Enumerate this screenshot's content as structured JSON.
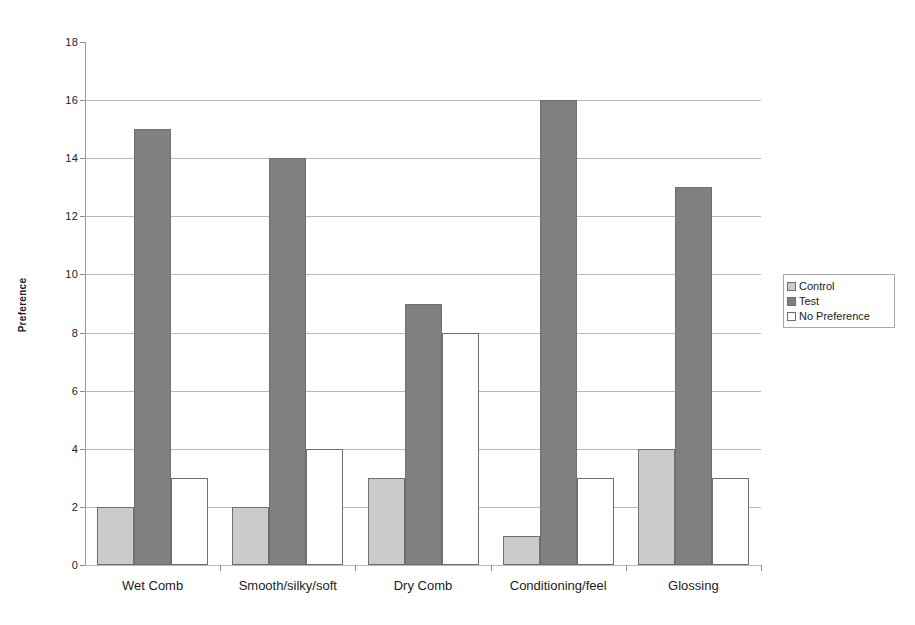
{
  "chart_data": {
    "type": "bar",
    "title": "",
    "subtitle": "",
    "xlabel": "",
    "ylabel": "Preference",
    "ylim": [
      0,
      18
    ],
    "ytick_step": 2,
    "yticks": [
      0,
      2,
      4,
      6,
      8,
      10,
      12,
      14,
      16,
      18
    ],
    "grid": true,
    "grid_axis": "y",
    "legend_position": "right",
    "categories": [
      "Wet Comb",
      "Smooth/silky/soft",
      "Dry Comb",
      "Conditioning/feel",
      "Glossing"
    ],
    "series": [
      {
        "name": "Control",
        "color": "#cbcbcb",
        "values": [
          2,
          2,
          3,
          1,
          4
        ]
      },
      {
        "name": "Test",
        "color": "#808080",
        "values": [
          15,
          14,
          9,
          16,
          13
        ]
      },
      {
        "name": "No Preference",
        "color": "#ffffff",
        "values": [
          3,
          4,
          8,
          3,
          3
        ]
      }
    ]
  },
  "legend": {
    "items": [
      {
        "label": "Control",
        "swatch": "control"
      },
      {
        "label": "Test",
        "swatch": "test"
      },
      {
        "label": "No Preference",
        "swatch": "nopref"
      }
    ]
  },
  "axes": {
    "y_title": "Preference",
    "y_tick_labels": [
      "0",
      "2",
      "4",
      "6",
      "8",
      "10",
      "12",
      "14",
      "16",
      "18"
    ],
    "x_tick_labels": [
      "Wet Comb",
      "Smooth/silky/soft",
      "Dry Comb",
      "Conditioning/feel",
      "Glossing"
    ]
  },
  "colors": {
    "control": "#cbcbcb",
    "test": "#808080",
    "no_preference": "#ffffff",
    "bar_border": "#6f6f6f",
    "gridline": "#b9b9b9",
    "axis": "#8f8f8f",
    "background": "#ffffff",
    "text": "#1c1c1c"
  }
}
